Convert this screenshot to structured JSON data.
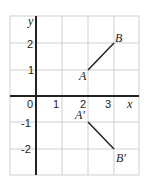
{
  "diagram": {
    "type": "coordinate-grid",
    "axes": {
      "x_label": "x",
      "y_label": "y"
    },
    "x_ticks": [
      "0",
      "1",
      "2",
      "3"
    ],
    "y_ticks": [
      "2",
      "1",
      "-1",
      "-2"
    ],
    "x_range": [
      -1,
      4
    ],
    "y_range": [
      -3,
      3
    ],
    "points": [
      {
        "label": "A",
        "x": 2,
        "y": 1
      },
      {
        "label": "B",
        "x": 3,
        "y": 2
      },
      {
        "label": "A'",
        "x": 2,
        "y": -1
      },
      {
        "label": "B'",
        "x": 3,
        "y": -2
      }
    ],
    "segments": [
      {
        "from": "A",
        "to": "B"
      },
      {
        "from": "A'",
        "to": "B'"
      }
    ],
    "colors": {
      "grid": "#cfcfcf",
      "axis": "#222222",
      "segment": "#222222",
      "background": "#ffffff"
    }
  }
}
